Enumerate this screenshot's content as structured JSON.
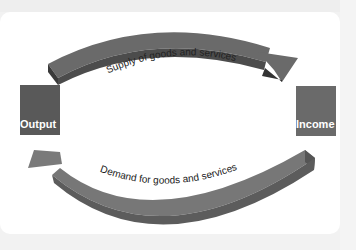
{
  "diagram": {
    "nodes": [
      {
        "id": "output",
        "label": "Output"
      },
      {
        "id": "income",
        "label": "Income"
      }
    ],
    "edges": [
      {
        "from": "output",
        "to": "income",
        "label": "Supply of goods and services"
      },
      {
        "from": "income",
        "to": "output",
        "label": "Demand for goods and services"
      }
    ],
    "colors": {
      "box": "#585858",
      "arrow": "#686868",
      "arrow_dark": "#3a3a3a",
      "text": "#222222"
    }
  }
}
